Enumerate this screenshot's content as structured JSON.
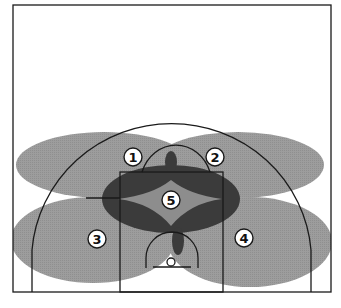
{
  "diagram": {
    "type": "basketball-half-court-zone-diagram",
    "colors": {
      "background": "#ffffff",
      "court_lines": "#1a1a1a",
      "zone_light": "#9a9a9a",
      "zone_dark": "#3a3a3a",
      "zone_center": "#8c8c8c",
      "label_fill": "#ffffff"
    },
    "zones": [
      {
        "id": "1",
        "label": "1",
        "position": "top-left wing"
      },
      {
        "id": "2",
        "label": "2",
        "position": "top-right wing"
      },
      {
        "id": "3",
        "label": "3",
        "position": "left baseline/corner"
      },
      {
        "id": "4",
        "label": "4",
        "position": "right baseline/corner"
      },
      {
        "id": "5",
        "label": "5",
        "position": "middle of key"
      }
    ]
  }
}
